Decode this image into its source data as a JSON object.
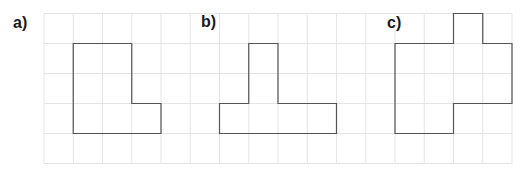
{
  "grid": {
    "origin_x": 44,
    "origin_y": 13.5,
    "cell_w": 29.25,
    "cell_h": 30,
    "cols": 16,
    "rows": 5,
    "line_color": "#e4e4e4",
    "shape_stroke": "#555555"
  },
  "figures": [
    {
      "label": "a)",
      "label_x": 12,
      "label_y": 15,
      "points": [
        [
          1,
          1
        ],
        [
          3,
          1
        ],
        [
          3,
          3
        ],
        [
          4,
          3
        ],
        [
          4,
          4
        ],
        [
          1,
          4
        ]
      ]
    },
    {
      "label": "b)",
      "label_x": 200,
      "label_y": 14,
      "points": [
        [
          7,
          1
        ],
        [
          8,
          1
        ],
        [
          8,
          3
        ],
        [
          10,
          3
        ],
        [
          10,
          4
        ],
        [
          6,
          4
        ],
        [
          6,
          3
        ],
        [
          7,
          3
        ]
      ]
    },
    {
      "label": "c)",
      "label_x": 386,
      "label_y": 15,
      "points": [
        [
          12,
          1
        ],
        [
          14,
          1
        ],
        [
          14,
          0
        ],
        [
          15,
          0
        ],
        [
          15,
          1
        ],
        [
          16,
          1
        ],
        [
          16,
          3
        ],
        [
          14,
          3
        ],
        [
          14,
          4
        ],
        [
          12,
          4
        ]
      ]
    }
  ]
}
